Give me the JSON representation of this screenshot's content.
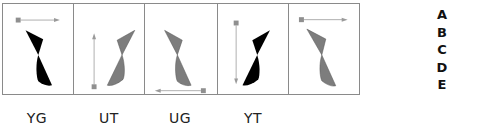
{
  "figure": {
    "type": "spatial-reasoning-puzzle",
    "panels": [
      {
        "index": 1,
        "shape_color": "black",
        "arrow": {
          "start": "square-top-left",
          "direction": "right"
        }
      },
      {
        "index": 2,
        "shape_color": "gray",
        "arrow": {
          "start": "square-bottom-left",
          "direction": "up"
        }
      },
      {
        "index": 3,
        "shape_color": "gray",
        "arrow": {
          "start": "square-bottom-right",
          "direction": "left"
        }
      },
      {
        "index": 4,
        "shape_color": "black",
        "arrow": {
          "start": "square-top-left",
          "direction": "down"
        }
      },
      {
        "index": 5,
        "shape_color": "gray",
        "arrow": {
          "start": "square-top-left",
          "direction": "right"
        }
      }
    ],
    "codes": [
      "YG",
      "UT",
      "UG",
      "YT"
    ],
    "options": [
      "A",
      "B",
      "C",
      "D",
      "E"
    ],
    "colors": {
      "black": "#000000",
      "gray": "#7d7d7d",
      "arrow": "#9a9a9a",
      "border": "#8a8a8a"
    }
  }
}
